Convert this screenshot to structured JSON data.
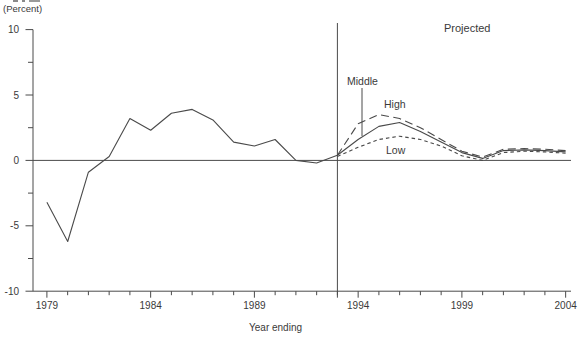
{
  "colors": {
    "line": "#4a4a4a",
    "axis": "#4a4a4a",
    "text": "#3a3a3a",
    "background": "#ffffff"
  },
  "chart_data": {
    "type": "line",
    "unit_label": "(Percent)",
    "xlabel": "Year ending",
    "ylim": [
      -10,
      10
    ],
    "xlim": [
      1979,
      2004
    ],
    "y_major_ticks": [
      10,
      5,
      0,
      -5,
      -10
    ],
    "y_tick_labels": [
      "10",
      "5",
      "0",
      "-5",
      "-10"
    ],
    "y_minor_step": 2.5,
    "x_major_ticks": [
      1979,
      1984,
      1989,
      1994,
      1999,
      2004
    ],
    "x_tick_labels": [
      "1979",
      "1984",
      "1989",
      "1994",
      "1999",
      "2004"
    ],
    "x_minor_step": 1,
    "grid": "off",
    "zero_line": true,
    "divider_year": 1993,
    "annotations": {
      "projected": "Projected",
      "middle": "Middle",
      "high": "High",
      "low": "Low"
    },
    "series": [
      {
        "name": "Historical",
        "line_style": "solid",
        "x": [
          1979,
          1980,
          1981,
          1982,
          1983,
          1984,
          1985,
          1986,
          1987,
          1988,
          1989,
          1990,
          1991,
          1992,
          1993
        ],
        "values": [
          -3.2,
          -6.2,
          -0.9,
          0.3,
          3.2,
          2.3,
          3.6,
          3.9,
          3.1,
          1.4,
          1.1,
          1.6,
          0.0,
          -0.2,
          0.4
        ]
      },
      {
        "name": "Middle",
        "line_style": "solid",
        "x": [
          1993,
          1994,
          1995,
          1996,
          1997,
          1998,
          1999,
          2000,
          2001,
          2002,
          2003,
          2004
        ],
        "values": [
          0.4,
          1.6,
          2.6,
          2.9,
          2.2,
          1.4,
          0.6,
          0.15,
          0.75,
          0.8,
          0.75,
          0.65
        ]
      },
      {
        "name": "High",
        "line_style": "long-dash",
        "x": [
          1993,
          1994,
          1995,
          1996,
          1997,
          1998,
          1999,
          2000,
          2001,
          2002,
          2003,
          2004
        ],
        "values": [
          0.4,
          2.8,
          3.5,
          3.2,
          2.5,
          1.6,
          0.7,
          0.25,
          0.85,
          0.9,
          0.85,
          0.75
        ]
      },
      {
        "name": "Low",
        "line_style": "short-dash",
        "x": [
          1993,
          1994,
          1995,
          1996,
          1997,
          1998,
          1999,
          2000,
          2001,
          2002,
          2003,
          2004
        ],
        "values": [
          0.3,
          1.0,
          1.6,
          1.85,
          1.6,
          1.1,
          0.35,
          0.0,
          0.6,
          0.7,
          0.65,
          0.55
        ]
      }
    ]
  }
}
